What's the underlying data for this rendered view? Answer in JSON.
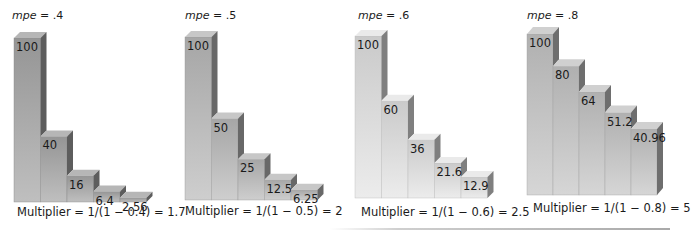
{
  "chart_data": [
    {
      "type": "bar",
      "title": "mpe = .4",
      "categories": [
        "Round 1",
        "Round 2",
        "Round 3",
        "Round 4",
        "Round 5"
      ],
      "values": [
        100,
        40,
        16,
        6.4,
        2.56
      ],
      "value_labels": [
        "100",
        "40",
        "16",
        "6.4",
        "2.56"
      ],
      "caption": "Multiplier = 1/(1 − 0.4) = 1.7",
      "style": "3d-stepped",
      "ylim": [
        0,
        100
      ],
      "color": "#a9a9a9"
    },
    {
      "type": "bar",
      "title": "mpe = .5",
      "categories": [
        "Round 1",
        "Round 2",
        "Round 3",
        "Round 4",
        "Round 5"
      ],
      "values": [
        100,
        50,
        25,
        12.5,
        6.25
      ],
      "value_labels": [
        "100",
        "50",
        "25",
        "12.5",
        "6.25"
      ],
      "caption": "Multiplier = 1/(1 − 0.5) = 2",
      "style": "3d-stepped",
      "ylim": [
        0,
        100
      ],
      "color": "#bdbdbd"
    },
    {
      "type": "bar",
      "title": "mpe = .6",
      "categories": [
        "Round 1",
        "Round 2",
        "Round 3",
        "Round 4",
        "Round 5"
      ],
      "values": [
        100,
        60,
        36,
        21.6,
        12.9
      ],
      "value_labels": [
        "100",
        "60",
        "36",
        "21.6",
        "12.9"
      ],
      "caption": "Multiplier = 1/(1 − 0.6) = 2.5",
      "style": "3d-stepped",
      "ylim": [
        0,
        100
      ],
      "color": "#e6e6e6"
    },
    {
      "type": "bar",
      "title": "mpe = .8",
      "categories": [
        "Round 1",
        "Round 2",
        "Round 3",
        "Round 4",
        "Round 5"
      ],
      "values": [
        100,
        80,
        64,
        51.2,
        40.96
      ],
      "value_labels": [
        "100",
        "80",
        "64",
        "51.2",
        "40.96"
      ],
      "caption": "Multiplier = 1/(1 − 0.8) = 5",
      "style": "3d-stepped",
      "ylim": [
        0,
        100
      ],
      "color": "#c8c8c8"
    }
  ],
  "panels": [
    {
      "mpe_var": "mpe",
      "mpe_eq": " = .4",
      "caption": "Multiplier = 1/(1 − 0.4) = 1.7"
    },
    {
      "mpe_var": "mpe",
      "mpe_eq": " = .5",
      "caption": "Multiplier = 1/(1 − 0.5) = 2"
    },
    {
      "mpe_var": "mpe",
      "mpe_eq": " = .6",
      "caption": "Multiplier = 1/(1 − 0.6) = 2.5"
    },
    {
      "mpe_var": "mpe",
      "mpe_eq": " = .8",
      "caption": "Multiplier = 1/(1 − 0.8) = 5"
    }
  ]
}
